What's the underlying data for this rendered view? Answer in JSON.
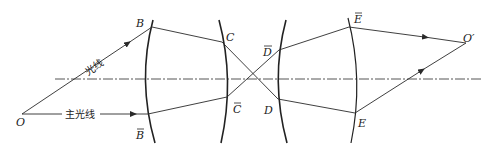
{
  "diagram": {
    "type": "optical-ray-diagram",
    "colors": {
      "line": "#2a2a2a",
      "axis": "#555555",
      "background": "#ffffff"
    },
    "labels": {
      "O": "O",
      "O_prime": "O′",
      "B": "B",
      "B_bar": "B",
      "C": "C",
      "C_bar": "C",
      "D": "D",
      "D_bar": "D",
      "E": "E",
      "E_bar": "E",
      "ray_label": "光线",
      "chief_ray_label": "主光线"
    },
    "points": {
      "O": [
        22,
        114
      ],
      "B": [
        152,
        27
      ],
      "B_bar": [
        148,
        114
      ],
      "C": [
        222,
        42
      ],
      "C_bar": [
        227,
        97
      ],
      "D_bar": [
        279,
        50
      ],
      "D": [
        278,
        99
      ],
      "E_bar": [
        349,
        27
      ],
      "E": [
        355,
        113
      ],
      "O_prime": [
        466,
        43
      ]
    },
    "optical_axis_y": 79
  }
}
